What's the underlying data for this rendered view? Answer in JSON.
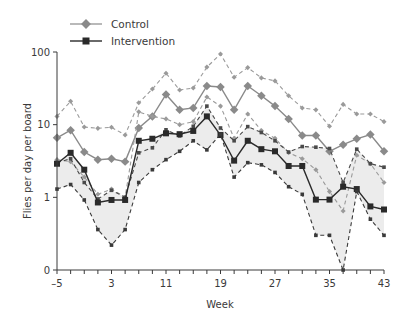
{
  "chart_data": {
    "type": "line",
    "title": "",
    "xlabel": "Week",
    "ylabel": "Flies per day per board",
    "yscale": "log",
    "ylim": [
      0.1,
      100
    ],
    "xlim": [
      -5,
      43
    ],
    "x_ticks_labeled": [
      -5,
      3,
      11,
      19,
      27,
      35,
      43
    ],
    "y_ticks": [
      {
        "label": "0",
        "value": 0.1
      },
      {
        "label": "1",
        "value": 1
      },
      {
        "label": "10",
        "value": 10
      },
      {
        "label": "100",
        "value": 100
      }
    ],
    "grid": false,
    "legend_position": "top-left",
    "legend": [
      {
        "label": "Control",
        "marker": "diamond",
        "color": "#8a8a8a"
      },
      {
        "label": "Intervention",
        "marker": "square",
        "color": "#2a2a2a"
      }
    ],
    "x": [
      -5,
      -3,
      -1,
      1,
      3,
      5,
      7,
      9,
      11,
      13,
      15,
      17,
      19,
      21,
      23,
      25,
      27,
      29,
      31,
      33,
      35,
      37,
      39,
      41,
      43
    ],
    "series": [
      {
        "name": "Control upper bound",
        "style": "dashed",
        "marker": "diamond",
        "color": "#9a9a9a",
        "values": [
          13,
          21,
          9.3,
          8.9,
          9.2,
          7.2,
          20,
          31,
          51,
          30,
          32,
          62,
          94,
          45,
          61,
          44,
          40,
          25,
          17,
          16,
          9.5,
          19,
          14,
          14,
          11
        ]
      },
      {
        "name": "Control",
        "style": "solid",
        "marker": "diamond",
        "color": "#8a8a8a",
        "values": [
          6.6,
          8.4,
          4.2,
          3.3,
          3.4,
          3.1,
          9.0,
          13,
          26,
          16,
          17,
          34,
          33,
          16,
          34,
          25,
          18,
          12,
          7.1,
          7.1,
          4.3,
          5.3,
          6.4,
          7.3,
          4.3
        ]
      },
      {
        "name": "Control lower bound",
        "style": "dashed",
        "marker": "diamond",
        "color": "#9a9a9a",
        "values": [
          3.3,
          3.1,
          1.9,
          1.1,
          1.3,
          1.0,
          15,
          13,
          12,
          10,
          11,
          24,
          18,
          6.5,
          14,
          8.3,
          6.5,
          4.1,
          3.4,
          2.4,
          1.2,
          0.65,
          3.8,
          2.9,
          1.6
        ]
      },
      {
        "name": "Intervention upper bound",
        "style": "dashed",
        "marker": "square",
        "color": "#4a4a4a",
        "values": [
          3.0,
          3.4,
          1.6,
          0.95,
          1.25,
          1.0,
          4.1,
          4.8,
          8.5,
          7.0,
          9.5,
          18,
          9.0,
          6.0,
          9.4,
          7.8,
          6.0,
          4.2,
          5.0,
          4.9,
          4.7,
          1.6,
          4.6,
          2.9,
          2.6
        ]
      },
      {
        "name": "Intervention",
        "style": "solid",
        "marker": "square",
        "color": "#2a2a2a",
        "values": [
          2.9,
          4.1,
          2.4,
          0.85,
          0.92,
          0.92,
          6.0,
          6.4,
          7.6,
          7.4,
          8.2,
          13,
          7.2,
          3.2,
          6.0,
          4.6,
          4.3,
          2.7,
          2.7,
          0.93,
          0.93,
          1.4,
          1.3,
          0.75,
          0.68
        ]
      },
      {
        "name": "Intervention lower bound",
        "style": "dashed",
        "marker": "square",
        "color": "#3a3a3a",
        "values": [
          1.3,
          1.5,
          0.92,
          0.36,
          0.22,
          0.36,
          1.6,
          2.4,
          3.3,
          4.3,
          6.0,
          4.5,
          7.4,
          1.9,
          3.0,
          2.8,
          2.2,
          1.4,
          1.1,
          0.3,
          0.3,
          0.1,
          1.2,
          0.5,
          0.3
        ]
      }
    ]
  }
}
